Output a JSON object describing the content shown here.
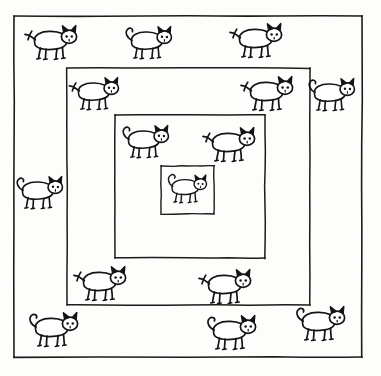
{
  "artwork": {
    "title": "Nested Squares with Cats",
    "description": "Hand-drawn line illustration of four concentric squares with cats distributed in each nested band",
    "background_color": "#fdfdfc",
    "ink_color": "#151414",
    "canvas": {
      "width": 381,
      "height": 376
    }
  },
  "frames": [
    {
      "name": "outer-frame",
      "x": 14,
      "y": 16,
      "width": 348,
      "height": 341,
      "stroke_width": 1.6
    },
    {
      "name": "second-frame",
      "x": 67,
      "y": 68,
      "width": 243,
      "height": 237,
      "stroke_width": 1.5
    },
    {
      "name": "third-frame",
      "x": 115,
      "y": 115,
      "width": 150,
      "height": 143,
      "stroke_width": 1.5
    },
    {
      "name": "inner-frame",
      "x": 161,
      "y": 166,
      "width": 53,
      "height": 48,
      "stroke_width": 1.4
    }
  ],
  "cats": [
    {
      "id": "cat-1",
      "label": "cat-outer-top-left",
      "band": "outer-band",
      "x": 54,
      "y": 44,
      "scale": 1.0,
      "tail": "spiky"
    },
    {
      "id": "cat-2",
      "label": "cat-outer-top-center",
      "band": "outer-band",
      "x": 150,
      "y": 44,
      "scale": 0.95,
      "tail": "curled"
    },
    {
      "id": "cat-3",
      "label": "cat-outer-top-right",
      "band": "outer-band",
      "x": 259,
      "y": 42,
      "scale": 1.0,
      "tail": "spiky"
    },
    {
      "id": "cat-4",
      "label": "cat-outer-right-upper",
      "band": "outer-band",
      "x": 333,
      "y": 96,
      "scale": 0.95,
      "tail": "curled"
    },
    {
      "id": "cat-5",
      "label": "cat-outer-left-middle",
      "band": "outer-band",
      "x": 41,
      "y": 194,
      "scale": 0.95,
      "tail": "curled"
    },
    {
      "id": "cat-6",
      "label": "cat-outer-bottom-left",
      "band": "outer-band",
      "x": 55,
      "y": 331,
      "scale": 1.0,
      "tail": "curled"
    },
    {
      "id": "cat-7",
      "label": "cat-outer-bottom-center",
      "band": "outer-band",
      "x": 233,
      "y": 334,
      "scale": 1.0,
      "tail": "curled"
    },
    {
      "id": "cat-8",
      "label": "cat-outer-bottom-right",
      "band": "outer-band",
      "x": 322,
      "y": 325,
      "scale": 1.0,
      "tail": "curled"
    },
    {
      "id": "cat-9",
      "label": "cat-second-top-left",
      "band": "second-band",
      "x": 97,
      "y": 95,
      "scale": 0.95,
      "tail": "spiky"
    },
    {
      "id": "cat-10",
      "label": "cat-second-top-right",
      "band": "second-band",
      "x": 270,
      "y": 95,
      "scale": 1.0,
      "tail": "spiky"
    },
    {
      "id": "cat-11",
      "label": "cat-second-bottom-left",
      "band": "second-band",
      "x": 103,
      "y": 285,
      "scale": 1.0,
      "tail": "spiky"
    },
    {
      "id": "cat-12",
      "label": "cat-second-bottom-right",
      "band": "second-band",
      "x": 228,
      "y": 288,
      "scale": 1.0,
      "tail": "spiky"
    },
    {
      "id": "cat-13",
      "label": "cat-third-top-left",
      "band": "third-band",
      "x": 147,
      "y": 143,
      "scale": 0.95,
      "tail": "curled"
    },
    {
      "id": "cat-14",
      "label": "cat-third-top-right",
      "band": "third-band",
      "x": 232,
      "y": 146,
      "scale": 1.0,
      "tail": "spiky"
    },
    {
      "id": "cat-15",
      "label": "cat-inner-center",
      "band": "inner-frame",
      "x": 188,
      "y": 190,
      "scale": 0.82,
      "tail": "curly-loop"
    }
  ],
  "counts": {
    "total_frames": 4,
    "total_cats": 15
  }
}
